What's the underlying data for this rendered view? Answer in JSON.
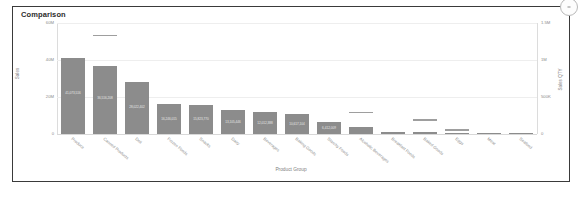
{
  "card": {
    "title": "Comparison",
    "corner_handle_icon": "resize-handle-icon"
  },
  "chart_data": {
    "type": "bar",
    "title": "Comparison",
    "xlabel": "Product Group",
    "ylabel": "Sales",
    "y2label": "Sales QTY",
    "grid": true,
    "legend": "none",
    "ylim": [
      0,
      60000000
    ],
    "y2lim": [
      0,
      1500000
    ],
    "ytick_labels": [
      "60M",
      "40M",
      "20M",
      "0"
    ],
    "ytick_values": [
      60000000,
      40000000,
      20000000,
      0
    ],
    "y2tick_labels": [
      "1.5M",
      "1M",
      "500K",
      "0"
    ],
    "y2tick_values": [
      1500000,
      1000000,
      500000,
      0
    ],
    "categories": [
      "Produce",
      "Canned Products",
      "Deli",
      "Frozen Foods",
      "Snacks",
      "Dairy",
      "Beverages",
      "Baking Goods",
      "Starchy Foods",
      "Alcoholic Beverages",
      "Breakfast Foods",
      "Baked Goods",
      "Eggs",
      "Meat",
      "Seafood"
    ],
    "series": [
      {
        "name": "Sales",
        "axis": "left",
        "values": [
          41000000,
          36500000,
          28000000,
          16200000,
          15800000,
          13100000,
          12000000,
          10600000,
          6400000,
          3600000,
          1100000,
          900000,
          400000,
          150000,
          80000
        ],
        "value_labels": [
          "41,073,516",
          "36,516,208",
          "28,022,402",
          "16,246,015",
          "15,823,770",
          "13,105,446",
          "12,012,388",
          "10,617,104",
          "6,412,009",
          "3,602,271",
          "1,108,334",
          "902,118",
          "411,220",
          "152,066",
          "78,940"
        ]
      },
      {
        "name": "Sales QTY",
        "axis": "right",
        "marker": "dash",
        "values": [
          0,
          1320000,
          0,
          0,
          0,
          0,
          0,
          0,
          0,
          280000,
          0,
          180000,
          40000,
          0,
          0
        ]
      }
    ]
  }
}
